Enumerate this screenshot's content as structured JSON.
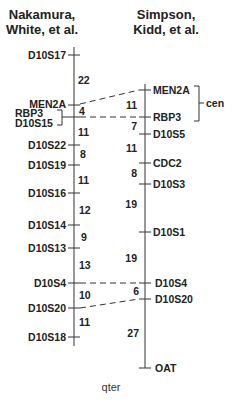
{
  "left_map": {
    "title_line1": "Nakamura,",
    "title_line2": "White, et al.",
    "markers": [
      {
        "name": "D10S17",
        "pos": 0
      },
      {
        "name": "MEN2A",
        "pos": 22
      },
      {
        "name": "RBP3 / D10S15",
        "pos": 26
      },
      {
        "name": "D10S22",
        "pos": 37
      },
      {
        "name": "D10S19",
        "pos": 45
      },
      {
        "name": "D10S16",
        "pos": 56
      },
      {
        "name": "D10S14",
        "pos": 68
      },
      {
        "name": "D10S13",
        "pos": 77
      },
      {
        "name": "D10S4",
        "pos": 90
      },
      {
        "name": "D10S20",
        "pos": 100
      },
      {
        "name": "D10S18",
        "pos": 111
      }
    ],
    "labels": {
      "D10S17": "D10S17",
      "MEN2A": "MEN2A",
      "RBP3": "RBP3",
      "D10S15": "D10S15",
      "D10S22": "D10S22",
      "D10S19": "D10S19",
      "D10S16": "D10S16",
      "D10S14": "D10S14",
      "D10S13": "D10S13",
      "D10S4": "D10S4",
      "D10S20": "D10S20",
      "D10S18": "D10S18"
    },
    "distances": [
      "22",
      "4",
      "11",
      "8",
      "11",
      "12",
      "9",
      "13",
      "10",
      "11"
    ]
  },
  "right_map": {
    "title_line1": "Simpson,",
    "title_line2": "Kidd, et al.",
    "labels": {
      "MEN2A": "MEN2A",
      "RBP3": "RBP3",
      "D10S5": "D10S5",
      "CDC2": "CDC2",
      "D10S3": "D10S3",
      "D10S1": "D10S1",
      "D10S4": "D10S4",
      "D10S20": "D10S20",
      "OAT": "OAT"
    },
    "distances": [
      "11",
      "7",
      "11",
      "8",
      "19",
      "19",
      "6",
      "27"
    ],
    "centromere_label": "cen"
  },
  "footer": {
    "qter": "qter"
  }
}
